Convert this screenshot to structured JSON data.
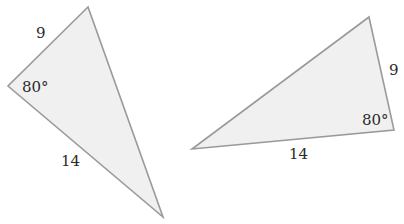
{
  "diagram": {
    "type": "congruent-triangles",
    "fill_color": "#f0f0f0",
    "stroke_color": "#9a9a9a",
    "triangles": [
      {
        "id": "left",
        "vertices": [
          [
            88,
            7
          ],
          [
            8,
            86
          ],
          [
            163,
            217
          ]
        ],
        "labels": {
          "side_short": "9",
          "angle": "80°",
          "side_long": "14"
        }
      },
      {
        "id": "right",
        "vertices": [
          [
            369,
            17
          ],
          [
            394,
            130
          ],
          [
            192,
            149
          ]
        ],
        "labels": {
          "side_short": "9",
          "angle": "80°",
          "side_long": "14"
        }
      }
    ]
  }
}
